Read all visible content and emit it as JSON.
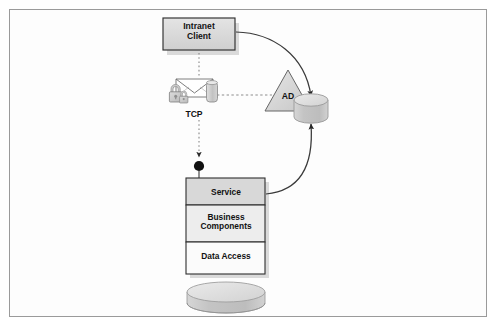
{
  "diagram": {
    "nodes": {
      "client": {
        "label": "Intranet\nClient",
        "line1": "Intranet",
        "line2": "Client",
        "name": "intranet-client-node"
      },
      "secure_channel": {
        "label": "TCP",
        "name": "secure-tcp-channel"
      },
      "directory": {
        "label": "AD",
        "name": "active-directory-node"
      },
      "directory_store": {
        "label": "",
        "name": "directory-store-cylinder"
      },
      "component_box": {
        "tiers": [
          {
            "label": "Service",
            "fill": "#d8d8d8"
          },
          {
            "label": "Business\nComponents",
            "line1": "Business",
            "line2": "Components",
            "fill": "#ededed"
          },
          {
            "label": "Data Access",
            "fill": "#fbfbfb"
          }
        ]
      },
      "database": {
        "label": "",
        "name": "application-database-cylinder"
      }
    },
    "edges": [
      {
        "from": "client",
        "to": "secure_channel",
        "style": "dashed",
        "arrow": "none",
        "name": "client-to-channel-link"
      },
      {
        "from": "secure_channel",
        "to": "component_box",
        "style": "dashed",
        "arrow": "filled",
        "label": "TCP",
        "name": "channel-to-service-link"
      },
      {
        "from": "secure_channel",
        "to": "directory",
        "style": "dashed",
        "arrow": "none",
        "name": "channel-to-ad-link"
      },
      {
        "from": "client",
        "to": "directory_store",
        "style": "solid-curve",
        "arrow": "filled",
        "name": "client-to-directory-curve"
      },
      {
        "from": "component_box",
        "to": "directory_store",
        "style": "solid-curve",
        "arrow": "filled",
        "name": "service-to-directory-curve"
      },
      {
        "from": "component_box",
        "to": "database",
        "style": "none",
        "arrow": "none",
        "name": "dataaccess-to-database-link"
      }
    ],
    "colors": {
      "frame_border": "#9a9a9a",
      "box_fill": "#d9d9d9",
      "box_border": "#3b3b3b",
      "tier_service_fill": "#d8d8d8",
      "tier_business_fill": "#ededed",
      "tier_data_fill": "#fbfbfb",
      "cylinder_fill": "#c9c9c9",
      "cylinder_top": "#e2e2e2",
      "triangle_fill": "#dadada",
      "line": "#3a3a3a",
      "dash": "#8d8d8d",
      "text": "#121212",
      "shadow": "#b9b9b9"
    }
  }
}
